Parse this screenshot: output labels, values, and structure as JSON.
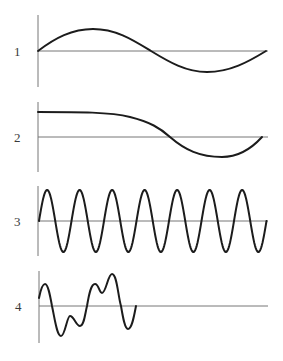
{
  "figure": {
    "colors": {
      "wave": "#1c1c1c",
      "axis": "#777777",
      "label": "#3a3a3a",
      "background": "#ffffff"
    }
  },
  "panels": [
    {
      "label": "1",
      "kind": "low-frequency sine, one full cycle",
      "axis": {
        "x": 38,
        "y_top": 15,
        "y_bottom": 87
      },
      "baseline": {
        "y": 51,
        "x_start": 38,
        "x_end": 268
      },
      "wave_path": "M38,51 C55,38 72,29 93,29 C116,29 133,40 151,51 C169,62 186,72 207,72 C230,72 248,62 266,51"
    },
    {
      "label": "2",
      "kind": "flat start then sine descent to trough and return",
      "axis": {
        "x": 38,
        "y_top": 102,
        "y_bottom": 172
      },
      "baseline": {
        "y": 137,
        "x_start": 38,
        "x_end": 268
      },
      "wave_path": "M38,112 C80,112 110,112 130,117 C150,122 160,128 170,137 C185,150 200,157 222,157 C240,157 252,148 262,137"
    },
    {
      "label": "3",
      "kind": "high-frequency sine, seven cycles",
      "axis": {
        "x": 38,
        "y_top": 186,
        "y_bottom": 256
      },
      "baseline": {
        "y": 221,
        "x_start": 38,
        "x_end": 268
      },
      "cycles": 7,
      "wave_start_x": 39,
      "period_px": 32.5,
      "amplitude_px": 31
    },
    {
      "label": "4",
      "kind": "complex composite wave, partial length",
      "axis": {
        "x": 39,
        "y_top": 271,
        "y_bottom": 343
      },
      "baseline": {
        "y": 306,
        "x_start": 39,
        "x_end": 268
      },
      "wave_path": "M39,298 C41,288 43,284 45,284 C48,284 50,295 52,306 C55,320 57,336 61,336 C65,336 67,316 70,316 C74,316 76,326 80,326 C84,326 85,314 87,306 C89,294 91,284 95,284 C99,284 99,293 102,293 C106,293 108,274 112,274 C117,274 118,296 121,306 C123,318 125,329 128,329 C132,329 134,316 136,306"
    }
  ]
}
